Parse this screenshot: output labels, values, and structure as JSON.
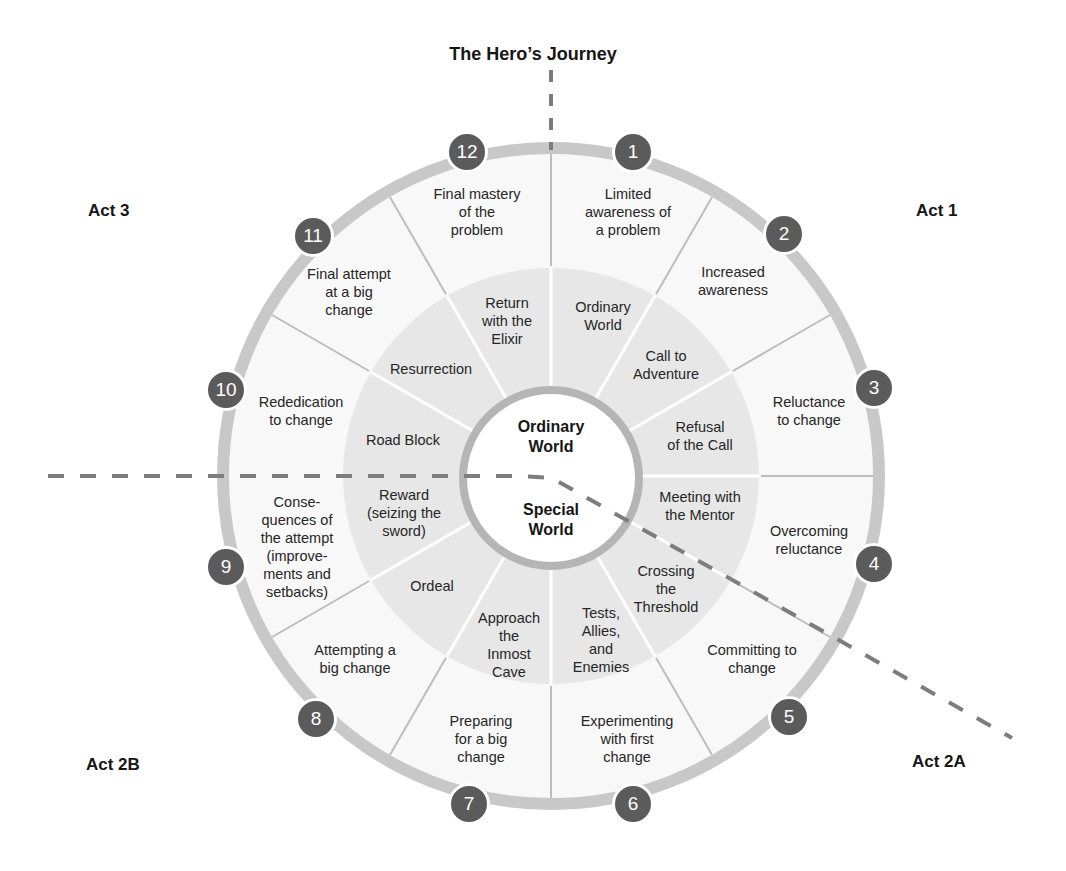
{
  "title": "The Hero’s Journey",
  "acts": [
    {
      "label": "Act 1",
      "x": 938,
      "y": 212
    },
    {
      "label": "Act 2A",
      "x": 942,
      "y": 763
    },
    {
      "label": "Act 2B",
      "x": 116,
      "y": 766
    },
    {
      "label": "Act 3",
      "x": 112,
      "y": 212
    }
  ],
  "center": {
    "upper_label": "Ordinary\nWorld",
    "lower_label": "Special\nWorld"
  },
  "colors": {
    "outer_ring": "#c8c8c8",
    "outer_fill": "#f8f8f8",
    "inner_fill": "#e7e7e7",
    "center_stroke": "#b5b5b5",
    "badge": "#5b5b5b",
    "divider_outer": "#bdbdbd",
    "dashed": "#7d7d7d"
  },
  "outer_stages": [
    {
      "num": "1",
      "label": "Limited\nawareness of\na problem"
    },
    {
      "num": "2",
      "label": "Increased\nawareness"
    },
    {
      "num": "3",
      "label": "Reluctance\nto change"
    },
    {
      "num": "4",
      "label": "Overcoming\nreluctance"
    },
    {
      "num": "5",
      "label": "Committing to\nchange"
    },
    {
      "num": "6",
      "label": "Experimenting\nwith first\nchange"
    },
    {
      "num": "7",
      "label": "Preparing\nfor a big\nchange"
    },
    {
      "num": "8",
      "label": "Attempting a\nbig change"
    },
    {
      "num": "9",
      "label": "Conse-\nquences of\nthe attempt\n(improve-\nments and\nsetbacks)"
    },
    {
      "num": "10",
      "label": "Rededication\nto change"
    },
    {
      "num": "11",
      "label": "Final attempt\nat a big\nchange"
    },
    {
      "num": "12",
      "label": "Final mastery\nof the\nproblem"
    }
  ],
  "inner_stages": [
    {
      "label": "Ordinary\nWorld"
    },
    {
      "label": "Call to\nAdventure"
    },
    {
      "label": "Refusal\nof the Call"
    },
    {
      "label": "Meeting with\nthe Mentor"
    },
    {
      "label": "Crossing\nthe\nThreshold"
    },
    {
      "label": "Tests,\nAllies,\nand\nEnemies"
    },
    {
      "label": "Approach\nthe\nInmost\nCave"
    },
    {
      "label": "Ordeal"
    },
    {
      "label": "Reward\n(seizing the\nsword)"
    },
    {
      "label": "Road Block"
    },
    {
      "label": "Resurrection"
    },
    {
      "label": "Return\nwith the\nElixir"
    }
  ]
}
